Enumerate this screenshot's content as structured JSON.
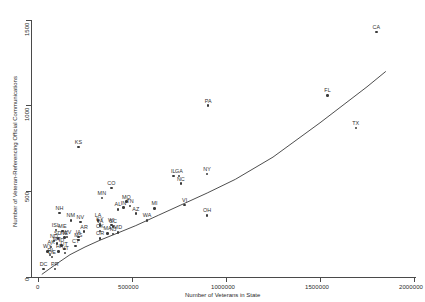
{
  "chart_data": {
    "type": "scatter",
    "title": "",
    "xlabel": "Number of Veterans in State",
    "ylabel": "Number of Veteran-Referencing Official Communications",
    "xlim": [
      0,
      2000000
    ],
    "ylim": [
      0,
      1500
    ],
    "grid": false,
    "legend": false,
    "xticks": [
      0,
      500000,
      1000000,
      1500000,
      2000000
    ],
    "xticklabels": [
      "0",
      "500000",
      "1000000",
      "1500000",
      "2000000"
    ],
    "yticks": [
      0,
      500,
      1000,
      1500
    ],
    "yticklabels": [
      "0",
      "500",
      "1000",
      "1500"
    ],
    "trend": {
      "type": "loess-smoothed-fit",
      "x": [
        20000,
        90000,
        170000,
        250000,
        330000,
        420000,
        520000,
        640000,
        760000,
        900000,
        1050000,
        1250000,
        1500000,
        1750000,
        1850000
      ],
      "y": [
        15,
        70,
        130,
        175,
        215,
        255,
        300,
        360,
        420,
        490,
        570,
        700,
        900,
        1110,
        1200
      ]
    },
    "points": [
      {
        "label": "CA",
        "x": 1800000,
        "y": 1430
      },
      {
        "label": "FL",
        "x": 1540000,
        "y": 1060
      },
      {
        "label": "TX",
        "x": 1690000,
        "y": 870
      },
      {
        "label": "PA",
        "x": 905000,
        "y": 1000
      },
      {
        "label": "KS",
        "x": 215000,
        "y": 760
      },
      {
        "label": "NY",
        "x": 900000,
        "y": 600
      },
      {
        "label": "GA",
        "x": 750000,
        "y": 590
      },
      {
        "label": "IL",
        "x": 720000,
        "y": 590
      },
      {
        "label": "NC",
        "x": 760000,
        "y": 545
      },
      {
        "label": "CO",
        "x": 390000,
        "y": 520
      },
      {
        "label": "VI",
        "x": 780000,
        "y": 420
      },
      {
        "label": "MI",
        "x": 620000,
        "y": 400
      },
      {
        "label": "OH",
        "x": 900000,
        "y": 360
      },
      {
        "label": "MN",
        "x": 340000,
        "y": 460
      },
      {
        "label": "MO",
        "x": 470000,
        "y": 440
      },
      {
        "label": "TN",
        "x": 490000,
        "y": 415
      },
      {
        "label": "IN",
        "x": 455000,
        "y": 405
      },
      {
        "label": "AL",
        "x": 425000,
        "y": 395
      },
      {
        "label": "AZ",
        "x": 520000,
        "y": 370
      },
      {
        "label": "WA",
        "x": 580000,
        "y": 330
      },
      {
        "label": "NH",
        "x": 115000,
        "y": 375
      },
      {
        "label": "NM",
        "x": 175000,
        "y": 330
      },
      {
        "label": "NV",
        "x": 225000,
        "y": 320
      },
      {
        "label": "LA",
        "x": 320000,
        "y": 330
      },
      {
        "label": "KY",
        "x": 330000,
        "y": 310
      },
      {
        "label": "VA",
        "x": 330000,
        "y": 300
      },
      {
        "label": "WI",
        "x": 390000,
        "y": 305
      },
      {
        "label": "SC",
        "x": 400000,
        "y": 295
      },
      {
        "label": "ISL",
        "x": 95000,
        "y": 275
      },
      {
        "label": "ME",
        "x": 130000,
        "y": 270
      },
      {
        "label": "OK",
        "x": 330000,
        "y": 270
      },
      {
        "label": "AR",
        "x": 245000,
        "y": 265
      },
      {
        "label": "OR",
        "x": 330000,
        "y": 225
      },
      {
        "label": "MA",
        "x": 370000,
        "y": 255
      },
      {
        "label": "MD",
        "x": 425000,
        "y": 260
      },
      {
        "label": "IA",
        "x": 215000,
        "y": 235
      },
      {
        "label": "MS",
        "x": 215000,
        "y": 215
      },
      {
        "label": "SD",
        "x": 105000,
        "y": 225
      },
      {
        "label": "ND",
        "x": 85000,
        "y": 210
      },
      {
        "label": "NE",
        "x": 140000,
        "y": 230
      },
      {
        "label": "WV",
        "x": 155000,
        "y": 235
      },
      {
        "label": "MT",
        "x": 100000,
        "y": 195
      },
      {
        "label": "ID",
        "x": 125000,
        "y": 185
      },
      {
        "label": "AK",
        "x": 70000,
        "y": 175
      },
      {
        "label": "WY",
        "x": 50000,
        "y": 150
      },
      {
        "label": "HI",
        "x": 110000,
        "y": 150
      },
      {
        "label": "VT",
        "x": 145000,
        "y": 140
      },
      {
        "label": "RI",
        "x": 65000,
        "y": 130
      },
      {
        "label": "CT",
        "x": 200000,
        "y": 180
      },
      {
        "label": "NJ",
        "x": 400000,
        "y": 250
      },
      {
        "label": "UT",
        "x": 140000,
        "y": 165
      },
      {
        "label": "DE",
        "x": 75000,
        "y": 115
      },
      {
        "label": "DC",
        "x": 30000,
        "y": 45
      },
      {
        "label": "PR",
        "x": 90000,
        "y": 45
      }
    ]
  },
  "axes": {
    "x_title": "Number of Veterans in State",
    "y_title": "Number of Veteran-Referencing Official Communications",
    "x_tick_0": "0",
    "x_tick_1": "500000",
    "x_tick_2": "1000000",
    "x_tick_3": "1500000",
    "x_tick_4": "2000000",
    "y_tick_0": "0",
    "y_tick_1": "500",
    "y_tick_2": "1000",
    "y_tick_3": "1500"
  },
  "colors": {
    "point": "#3a3a3a",
    "axis": "#4a4a4a",
    "text": "#2b2b2b",
    "trend": "#3a3a3a",
    "background": "#ffffff"
  }
}
